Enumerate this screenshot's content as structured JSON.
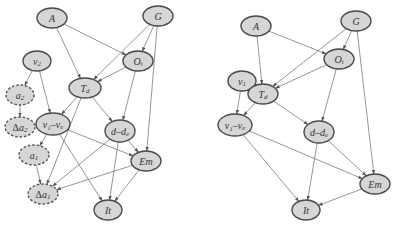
{
  "figure": {
    "colors": {
      "node_fill": "#d6d6d6",
      "node_stroke": "#4a4a4a",
      "edge": "#7a7a7a",
      "background": "#ffffff"
    }
  },
  "graphs": [
    {
      "id": "left",
      "nodes": [
        {
          "id": "A",
          "label": "A",
          "sub": "",
          "pre": "",
          "x": 52,
          "y": 18,
          "rx": 15,
          "ry": 10,
          "dashed": false
        },
        {
          "id": "G",
          "label": "G",
          "sub": "",
          "pre": "",
          "x": 158,
          "y": 16,
          "rx": 15,
          "ry": 10,
          "dashed": false
        },
        {
          "id": "Ot",
          "label": "O",
          "sub": "t",
          "pre": "",
          "x": 138,
          "y": 61,
          "rx": 15,
          "ry": 10,
          "dashed": false
        },
        {
          "id": "v2",
          "label": "v",
          "sub": "2",
          "pre": "",
          "x": 37,
          "y": 61,
          "rx": 14,
          "ry": 10,
          "dashed": false
        },
        {
          "id": "Td",
          "label": "T",
          "sub": "d",
          "pre": "",
          "x": 85,
          "y": 88,
          "rx": 16,
          "ry": 10,
          "dashed": false
        },
        {
          "id": "a2",
          "label": "a",
          "sub": "2",
          "pre": "",
          "x": 20,
          "y": 95,
          "rx": 14,
          "ry": 10,
          "dashed": true
        },
        {
          "id": "da2",
          "label": "a",
          "sub": "2",
          "pre": "Δ",
          "x": 20,
          "y": 127,
          "rx": 15,
          "ry": 10,
          "dashed": true
        },
        {
          "id": "v1ve",
          "label": "v₁–v",
          "sub": "e",
          "pre": "",
          "x": 53,
          "y": 124,
          "rx": 17,
          "ry": 11,
          "dashed": false
        },
        {
          "id": "dde",
          "label": "d–d",
          "sub": "e",
          "pre": "",
          "x": 120,
          "y": 131,
          "rx": 15,
          "ry": 11,
          "dashed": false
        },
        {
          "id": "a1",
          "label": "a",
          "sub": "1",
          "pre": "",
          "x": 34,
          "y": 155,
          "rx": 15,
          "ry": 10,
          "dashed": true
        },
        {
          "id": "Em",
          "label": "Em",
          "sub": "",
          "pre": "",
          "x": 146,
          "y": 161,
          "rx": 15,
          "ry": 10,
          "dashed": false
        },
        {
          "id": "da1",
          "label": "a",
          "sub": "1",
          "pre": "Δ",
          "x": 43,
          "y": 194,
          "rx": 15,
          "ry": 10,
          "dashed": true
        },
        {
          "id": "It",
          "label": "It",
          "sub": "",
          "pre": "",
          "x": 108,
          "y": 210,
          "rx": 14,
          "ry": 10,
          "dashed": false
        }
      ],
      "edges": [
        [
          "A",
          "Td"
        ],
        [
          "A",
          "Ot"
        ],
        [
          "G",
          "Ot"
        ],
        [
          "G",
          "Td"
        ],
        [
          "G",
          "Em"
        ],
        [
          "Ot",
          "Td"
        ],
        [
          "Ot",
          "dde"
        ],
        [
          "v2",
          "a2"
        ],
        [
          "v2",
          "v1ve"
        ],
        [
          "a2",
          "da2"
        ],
        [
          "Td",
          "v1ve"
        ],
        [
          "Td",
          "dde"
        ],
        [
          "Td",
          "da1"
        ],
        [
          "v1ve",
          "a1"
        ],
        [
          "v1ve",
          "Em"
        ],
        [
          "v1ve",
          "It"
        ],
        [
          "dde",
          "Em"
        ],
        [
          "dde",
          "It"
        ],
        [
          "dde",
          "da1"
        ],
        [
          "a1",
          "da1"
        ],
        [
          "Em",
          "It"
        ],
        [
          "Em",
          "da1"
        ]
      ]
    },
    {
      "id": "right",
      "nodes": [
        {
          "id": "A",
          "label": "A",
          "sub": "",
          "pre": "",
          "x": 256,
          "y": 26,
          "rx": 15,
          "ry": 10,
          "dashed": false
        },
        {
          "id": "G",
          "label": "G",
          "sub": "",
          "pre": "",
          "x": 356,
          "y": 21,
          "rx": 15,
          "ry": 10,
          "dashed": false
        },
        {
          "id": "Ot",
          "label": "O",
          "sub": "t",
          "pre": "",
          "x": 339,
          "y": 59,
          "rx": 15,
          "ry": 10,
          "dashed": false
        },
        {
          "id": "v1",
          "label": "v",
          "sub": "1",
          "pre": "",
          "x": 242,
          "y": 81,
          "rx": 14,
          "ry": 10,
          "dashed": false
        },
        {
          "id": "Td",
          "label": "T",
          "sub": "d",
          "pre": "",
          "x": 263,
          "y": 94,
          "rx": 15,
          "ry": 10,
          "dashed": false
        },
        {
          "id": "v1ve",
          "label": "v₁–v",
          "sub": "e",
          "pre": "",
          "x": 235,
          "y": 125,
          "rx": 17,
          "ry": 11,
          "dashed": false
        },
        {
          "id": "dde",
          "label": "d–d",
          "sub": "e",
          "pre": "",
          "x": 319,
          "y": 132,
          "rx": 15,
          "ry": 11,
          "dashed": false
        },
        {
          "id": "Em",
          "label": "Em",
          "sub": "",
          "pre": "",
          "x": 375,
          "y": 184,
          "rx": 15,
          "ry": 10,
          "dashed": false
        },
        {
          "id": "It",
          "label": "It",
          "sub": "",
          "pre": "",
          "x": 306,
          "y": 210,
          "rx": 14,
          "ry": 10,
          "dashed": false
        }
      ],
      "edges": [
        [
          "A",
          "Td"
        ],
        [
          "A",
          "Ot"
        ],
        [
          "G",
          "Ot"
        ],
        [
          "G",
          "Td"
        ],
        [
          "G",
          "Em"
        ],
        [
          "Ot",
          "Td"
        ],
        [
          "Ot",
          "dde"
        ],
        [
          "v1",
          "v1ve"
        ],
        [
          "Td",
          "v1ve"
        ],
        [
          "Td",
          "dde"
        ],
        [
          "v1ve",
          "Em"
        ],
        [
          "v1ve",
          "It"
        ],
        [
          "dde",
          "Em"
        ],
        [
          "dde",
          "It"
        ],
        [
          "Em",
          "It"
        ]
      ]
    }
  ]
}
